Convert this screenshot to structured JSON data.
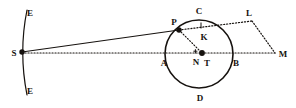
{
  "figure": {
    "width": 296,
    "height": 108,
    "background_color": "#ffffff",
    "ink_color": "#16120f"
  },
  "labels": {
    "e_top": "E",
    "e_bottom": "E",
    "s": "S",
    "a": "A",
    "b": "B",
    "c": "C",
    "d": "D",
    "p": "P",
    "k": "K",
    "n": "N",
    "t": "T",
    "l": "L",
    "m": "M"
  },
  "label_positions": {
    "e_top": {
      "x": 30,
      "y": 13
    },
    "e_bottom": {
      "x": 30,
      "y": 91
    },
    "s": {
      "x": 14,
      "y": 53
    },
    "a": {
      "x": 164,
      "y": 63
    },
    "b": {
      "x": 236,
      "y": 63
    },
    "c": {
      "x": 199,
      "y": 11
    },
    "d": {
      "x": 200,
      "y": 98
    },
    "p": {
      "x": 174,
      "y": 22
    },
    "k": {
      "x": 204,
      "y": 37
    },
    "n": {
      "x": 196,
      "y": 62
    },
    "t": {
      "x": 207,
      "y": 63
    },
    "l": {
      "x": 249,
      "y": 13
    },
    "m": {
      "x": 283,
      "y": 54
    }
  },
  "points": {
    "s": {
      "x": 22,
      "y": 52,
      "marker": "filled-dot",
      "radius": 2.6
    },
    "p": {
      "x": 179,
      "y": 30,
      "marker": "filled-dot",
      "radius": 2.6
    },
    "t": {
      "x": 202,
      "y": 53,
      "marker": "filled-dot",
      "radius": 2.8
    },
    "n": {
      "x": 196,
      "y": 53,
      "marker": "cross-tick"
    },
    "k": {
      "x": 201,
      "y": 30,
      "marker": "tick"
    },
    "l": {
      "x": 252,
      "y": 21,
      "marker": "vertex"
    },
    "m": {
      "x": 275,
      "y": 53,
      "marker": "vertex"
    }
  },
  "circle": {
    "center_x": 199,
    "center_y": 54,
    "radius": 34,
    "stroke_width": 1.5,
    "style": "solid"
  },
  "arc_left": {
    "description": "vertical arc through E-S-E bowing left",
    "top_x": 27,
    "top_y": 10,
    "bottom_x": 27,
    "bottom_y": 95,
    "through_x": 21,
    "through_y": 52,
    "stroke_width": 1.2,
    "style": "solid"
  },
  "segments": [
    {
      "name": "s-to-p",
      "from": "S",
      "to": "P",
      "style": "solid",
      "x1": 22,
      "y1": 52,
      "x2": 179,
      "y2": 30
    },
    {
      "name": "s-to-m-baseline",
      "from": "S",
      "to": "M",
      "style": "dotted",
      "x1": 22,
      "y1": 53,
      "x2": 275,
      "y2": 53
    },
    {
      "name": "p-to-l",
      "from": "P",
      "to": "L",
      "style": "dotted",
      "x1": 179,
      "y1": 30,
      "x2": 252,
      "y2": 21
    },
    {
      "name": "p-to-t",
      "from": "P",
      "to": "T",
      "style": "dotted",
      "x1": 179,
      "y1": 30,
      "x2": 202,
      "y2": 53
    },
    {
      "name": "l-to-m",
      "from": "L",
      "to": "M",
      "style": "dotted",
      "x1": 252,
      "y1": 21,
      "x2": 275,
      "y2": 53
    },
    {
      "name": "k-tick",
      "from": "K",
      "to": "arc",
      "style": "solid",
      "x1": 201,
      "y1": 23,
      "x2": 201,
      "y2": 29
    }
  ]
}
